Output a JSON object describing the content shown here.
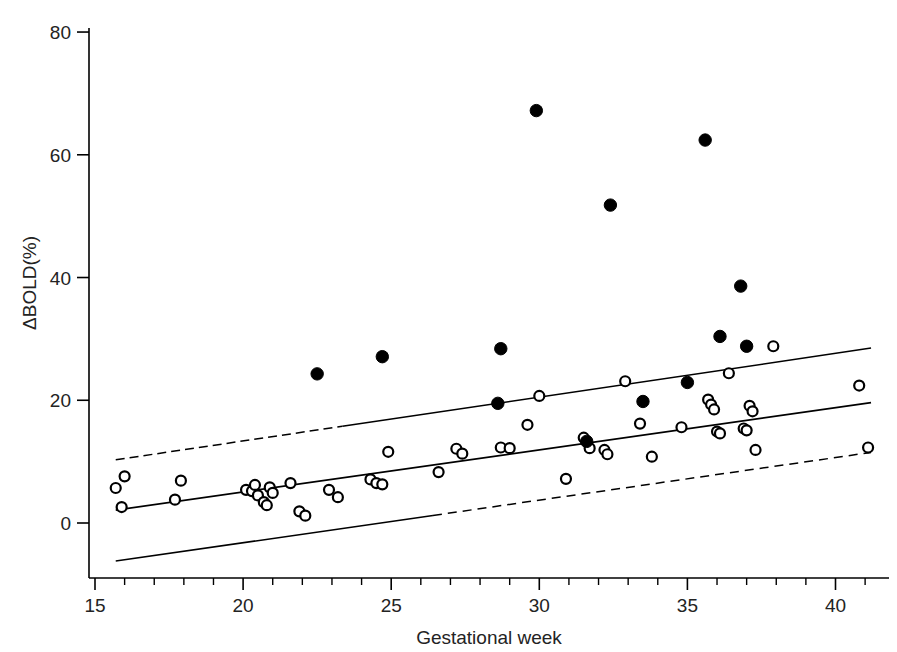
{
  "chart_data": {
    "type": "scatter",
    "title": "",
    "xlabel": "Gestational week",
    "ylabel": "ΔBOLD(%)",
    "xlim": [
      14.7,
      41.8
    ],
    "ylim": [
      -10.5,
      82
    ],
    "xticks": [
      15,
      20,
      25,
      30,
      35,
      40
    ],
    "xtick_labels": [
      "15",
      "20",
      "25",
      "30",
      "35",
      "40"
    ],
    "x_minor_tick_step": 1,
    "yticks": [
      0,
      20,
      40,
      60,
      80
    ],
    "ytick_labels": [
      "0",
      "20",
      "40",
      "60",
      "80"
    ],
    "grid": false,
    "legend": null,
    "axis_style": "left-and-bottom-spines-only",
    "marker_colors": {
      "open_circle_stroke": "#000000",
      "open_circle_fill": "#ffffff",
      "filled_circle_fill": "#000000",
      "line_color": "#000000",
      "background": "#ffffff"
    },
    "series": [
      {
        "name": "open-circles",
        "marker": "open-circle",
        "points": [
          [
            15.7,
            5.7
          ],
          [
            15.9,
            2.6
          ],
          [
            16.0,
            7.6
          ],
          [
            17.7,
            3.8
          ],
          [
            17.9,
            6.9
          ],
          [
            20.1,
            5.4
          ],
          [
            20.3,
            5.2
          ],
          [
            20.4,
            6.2
          ],
          [
            20.5,
            4.5
          ],
          [
            20.7,
            3.4
          ],
          [
            20.8,
            2.9
          ],
          [
            20.9,
            5.8
          ],
          [
            21.0,
            4.9
          ],
          [
            21.6,
            6.5
          ],
          [
            21.9,
            1.9
          ],
          [
            22.1,
            1.2
          ],
          [
            22.9,
            5.4
          ],
          [
            23.2,
            4.2
          ],
          [
            24.3,
            7.1
          ],
          [
            24.5,
            6.5
          ],
          [
            24.7,
            6.3
          ],
          [
            24.9,
            11.6
          ],
          [
            26.6,
            8.3
          ],
          [
            27.2,
            12.1
          ],
          [
            27.4,
            11.3
          ],
          [
            28.7,
            12.3
          ],
          [
            29.0,
            12.2
          ],
          [
            29.6,
            16.0
          ],
          [
            30.0,
            20.7
          ],
          [
            30.9,
            7.2
          ],
          [
            31.5,
            13.9
          ],
          [
            31.7,
            12.2
          ],
          [
            32.2,
            11.9
          ],
          [
            32.3,
            11.2
          ],
          [
            32.9,
            23.1
          ],
          [
            33.4,
            16.2
          ],
          [
            33.8,
            10.8
          ],
          [
            34.8,
            15.6
          ],
          [
            35.7,
            20.1
          ],
          [
            35.8,
            19.3
          ],
          [
            35.9,
            18.5
          ],
          [
            36.0,
            14.9
          ],
          [
            36.1,
            14.6
          ],
          [
            36.4,
            24.4
          ],
          [
            36.9,
            15.4
          ],
          [
            37.0,
            15.1
          ],
          [
            37.1,
            19.1
          ],
          [
            37.2,
            18.2
          ],
          [
            37.3,
            11.9
          ],
          [
            37.9,
            28.8
          ],
          [
            40.8,
            22.4
          ],
          [
            41.1,
            12.3
          ]
        ]
      },
      {
        "name": "filled-circles",
        "marker": "filled-circle",
        "points": [
          [
            22.5,
            24.3
          ],
          [
            24.7,
            27.1
          ],
          [
            28.6,
            19.5
          ],
          [
            28.7,
            28.4
          ],
          [
            29.9,
            67.2
          ],
          [
            31.6,
            13.3
          ],
          [
            32.4,
            51.8
          ],
          [
            33.5,
            19.8
          ],
          [
            35.0,
            22.9
          ],
          [
            35.6,
            62.4
          ],
          [
            36.1,
            30.4
          ],
          [
            36.8,
            38.6
          ],
          [
            37.0,
            28.8
          ]
        ]
      }
    ],
    "lines": [
      {
        "name": "upper-confidence-band",
        "style": "solid-with-dashed-left-segment",
        "x_start": 15.7,
        "y_start": 10.3,
        "x_end": 41.2,
        "y_end": 28.5
      },
      {
        "name": "regression-line",
        "style": "solid",
        "x_start": 15.7,
        "y_start": 2.1,
        "x_end": 41.2,
        "y_end": 19.6
      },
      {
        "name": "lower-confidence-band",
        "style": "solid-with-dashed-right-segment",
        "x_start": 15.7,
        "y_start": -6.2,
        "x_end": 41.2,
        "y_end": 11.5
      }
    ]
  }
}
